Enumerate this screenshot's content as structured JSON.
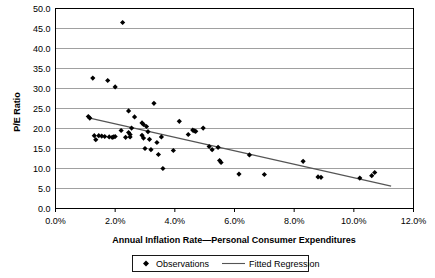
{
  "chart_data": {
    "type": "scatter",
    "title": "",
    "xlabel": "Annual Inflation Rate—Personal Consumer Expenditures",
    "ylabel": "P/E Ratio",
    "xlim": [
      0.0,
      12.0
    ],
    "ylim": [
      0.0,
      50.0
    ],
    "x_tick_labels": [
      "0.0%",
      "2.0%",
      "4.0%",
      "6.0%",
      "8.0%",
      "10.0%",
      "12.0%"
    ],
    "x_tick_values": [
      0.0,
      2.0,
      4.0,
      6.0,
      8.0,
      10.0,
      12.0
    ],
    "y_tick_labels": [
      "0.0",
      "5.0",
      "10.0",
      "15.0",
      "20.0",
      "25.0",
      "30.0",
      "35.0",
      "40.0",
      "45.0",
      "50.0"
    ],
    "y_tick_values": [
      0.0,
      5.0,
      10.0,
      15.0,
      20.0,
      25.0,
      30.0,
      35.0,
      40.0,
      45.0,
      50.0
    ],
    "grid": "horizontal",
    "legend_position": "bottom",
    "legend": [
      {
        "label": "Observations",
        "marker": "diamond",
        "color": "#000000"
      },
      {
        "label": "Fitted Regression",
        "marker": "line",
        "color": "#555555"
      }
    ],
    "series": [
      {
        "name": "Observations",
        "marker": "diamond",
        "color": "#000000",
        "points": [
          [
            1.25,
            32.6
          ],
          [
            1.75,
            32.0
          ],
          [
            2.0,
            30.4
          ],
          [
            2.25,
            46.5
          ],
          [
            1.15,
            22.6
          ],
          [
            1.1,
            23.0
          ],
          [
            1.3,
            18.2
          ],
          [
            1.35,
            17.2
          ],
          [
            1.65,
            18.0
          ],
          [
            1.8,
            17.9
          ],
          [
            1.9,
            17.8
          ],
          [
            1.95,
            17.9
          ],
          [
            2.0,
            18.0
          ],
          [
            2.45,
            24.4
          ],
          [
            2.65,
            22.9
          ],
          [
            2.45,
            19.0
          ],
          [
            2.5,
            18.5
          ],
          [
            2.5,
            17.9
          ],
          [
            2.55,
            20.1
          ],
          [
            2.9,
            21.4
          ],
          [
            2.95,
            21.0
          ],
          [
            2.9,
            18.3
          ],
          [
            2.95,
            17.6
          ],
          [
            3.0,
            15.0
          ],
          [
            3.05,
            20.5
          ],
          [
            3.1,
            19.2
          ],
          [
            3.15,
            17.3
          ],
          [
            3.3,
            26.3
          ],
          [
            3.2,
            14.7
          ],
          [
            3.4,
            16.5
          ],
          [
            3.45,
            13.5
          ],
          [
            3.55,
            17.9
          ],
          [
            3.6,
            10.0
          ],
          [
            3.95,
            14.5
          ],
          [
            4.15,
            21.8
          ],
          [
            4.45,
            18.5
          ],
          [
            4.6,
            19.6
          ],
          [
            4.65,
            19.4
          ],
          [
            4.7,
            19.3
          ],
          [
            4.95,
            20.1
          ],
          [
            5.15,
            15.5
          ],
          [
            5.25,
            14.7
          ],
          [
            5.45,
            15.3
          ],
          [
            5.5,
            12.0
          ],
          [
            5.55,
            11.5
          ],
          [
            6.15,
            8.6
          ],
          [
            6.5,
            13.4
          ],
          [
            7.0,
            8.5
          ],
          [
            8.3,
            11.8
          ],
          [
            8.8,
            7.9
          ],
          [
            8.9,
            7.8
          ],
          [
            10.2,
            7.6
          ],
          [
            10.7,
            9.0
          ],
          [
            10.6,
            8.2
          ],
          [
            2.2,
            19.5
          ],
          [
            2.35,
            17.8
          ],
          [
            1.55,
            18.1
          ],
          [
            1.45,
            18.2
          ]
        ]
      }
    ],
    "fitted_regression": {
      "name": "Fitted Regression",
      "color": "#555555",
      "x_start": 1.15,
      "y_start": 22.6,
      "x_end": 11.25,
      "y_end": 5.6
    }
  },
  "axis": {
    "y_title": "P/E Ratio",
    "x_title": "Annual Inflation Rate—Personal Consumer Expenditures"
  }
}
